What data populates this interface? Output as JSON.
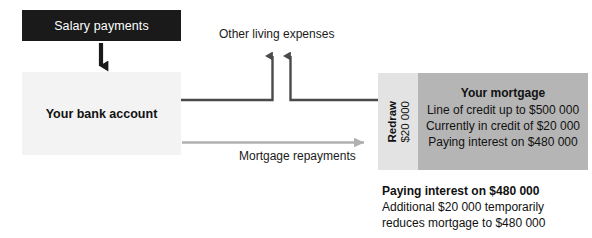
{
  "diagram": {
    "salary_box": {
      "label": "Salary payments"
    },
    "bank_box": {
      "label": "Your bank account"
    },
    "other_living_expenses_label": "Other living expenses",
    "mortgage_repayments_label": "Mortgage repayments",
    "mortgage_box": {
      "redraw_label": "Redraw",
      "redraw_amount": "$20 000",
      "title": "Your mortgage",
      "lines": [
        "Line of credit up to $500 000",
        "Currently in credit of $20 000",
        "Paying interest on $480 000"
      ]
    },
    "caption": {
      "title": "Paying interest on $480 000",
      "lines": [
        "Additional $20 000 temporarily",
        "reduces mortgage to $480 000"
      ]
    },
    "colors": {
      "salary_box_fill": "#1a1a1a",
      "salary_box_text": "#ffffff",
      "bank_box_fill": "#f3f3f3",
      "mortgage_redraw_fill": "#e3e3e3",
      "mortgage_main_fill": "#b5b5b5",
      "dark_connector": "#4a4a4a",
      "light_connector": "#b0b0b0",
      "body_text": "#111111",
      "page_background": "#ffffff"
    }
  }
}
